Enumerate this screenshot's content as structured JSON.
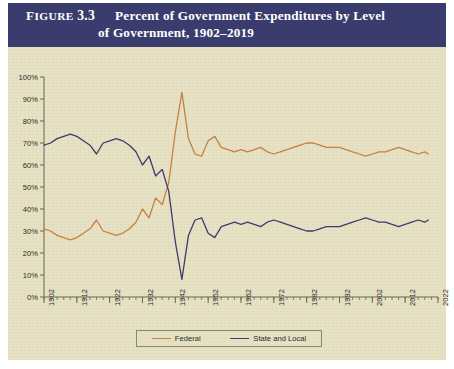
{
  "figure": {
    "label_small_caps": "IGURE",
    "label_first_letter": "F",
    "number": "3.3",
    "title_line1": "Percent of Government Expenditures by Level",
    "title_line2": "of Government, 1902–2019",
    "band_color": "#3b3c6e",
    "panel_color": "#e6e2c3"
  },
  "chart_data": {
    "type": "line",
    "title": "Percent of Government Expenditures by Level of Government, 1902–2019",
    "xlabel": "",
    "ylabel": "",
    "ylim": [
      0,
      100
    ],
    "xlim": [
      1902,
      2022
    ],
    "grid": false,
    "legend_position": "bottom",
    "y_ticks": [
      "0%",
      "10%",
      "20%",
      "30%",
      "40%",
      "50%",
      "60%",
      "70%",
      "80%",
      "90%",
      "100%"
    ],
    "y_tick_values": [
      0,
      10,
      20,
      30,
      40,
      50,
      60,
      70,
      80,
      90,
      100
    ],
    "x_ticks": [
      "1902",
      "1912",
      "1922",
      "1932",
      "1942",
      "1952",
      "1962",
      "1972",
      "1982",
      "1992",
      "2002",
      "2012",
      "2022"
    ],
    "x_tick_values": [
      1902,
      1912,
      1922,
      1932,
      1942,
      1952,
      1962,
      1972,
      1982,
      1992,
      2002,
      2012,
      2022
    ],
    "x_minor_tick_step": 2,
    "series": [
      {
        "name": "Federal",
        "color": "#c8803f",
        "x": [
          1902,
          1904,
          1906,
          1908,
          1910,
          1912,
          1914,
          1916,
          1918,
          1920,
          1922,
          1924,
          1926,
          1928,
          1930,
          1932,
          1934,
          1936,
          1938,
          1940,
          1942,
          1944,
          1946,
          1948,
          1950,
          1952,
          1954,
          1956,
          1958,
          1960,
          1962,
          1964,
          1966,
          1968,
          1970,
          1972,
          1974,
          1976,
          1978,
          1980,
          1982,
          1984,
          1986,
          1988,
          1990,
          1992,
          1994,
          1996,
          1998,
          2000,
          2002,
          2004,
          2006,
          2008,
          2010,
          2012,
          2014,
          2016,
          2018,
          2019
        ],
        "values": [
          31,
          30,
          28,
          27,
          26,
          27,
          29,
          31,
          35,
          30,
          29,
          28,
          29,
          31,
          34,
          40,
          36,
          45,
          42,
          52,
          75,
          93,
          72,
          65,
          64,
          71,
          73,
          68,
          67,
          66,
          67,
          66,
          67,
          68,
          66,
          65,
          66,
          67,
          68,
          69,
          70,
          70,
          69,
          68,
          68,
          68,
          67,
          66,
          65,
          64,
          65,
          66,
          66,
          67,
          68,
          67,
          66,
          65,
          66,
          65
        ]
      },
      {
        "name": "State and Local",
        "color": "#3b3c6e",
        "x": [
          1902,
          1904,
          1906,
          1908,
          1910,
          1912,
          1914,
          1916,
          1918,
          1920,
          1922,
          1924,
          1926,
          1928,
          1930,
          1932,
          1934,
          1936,
          1938,
          1940,
          1942,
          1944,
          1946,
          1948,
          1950,
          1952,
          1954,
          1956,
          1958,
          1960,
          1962,
          1964,
          1966,
          1968,
          1970,
          1972,
          1974,
          1976,
          1978,
          1980,
          1982,
          1984,
          1986,
          1988,
          1990,
          1992,
          1994,
          1996,
          1998,
          2000,
          2002,
          2004,
          2006,
          2008,
          2010,
          2012,
          2014,
          2016,
          2018,
          2019
        ],
        "values": [
          69,
          70,
          72,
          73,
          74,
          73,
          71,
          69,
          65,
          70,
          71,
          72,
          71,
          69,
          66,
          60,
          64,
          55,
          58,
          48,
          25,
          8,
          28,
          35,
          36,
          29,
          27,
          32,
          33,
          34,
          33,
          34,
          33,
          32,
          34,
          35,
          34,
          33,
          32,
          31,
          30,
          30,
          31,
          32,
          32,
          32,
          33,
          34,
          35,
          36,
          35,
          34,
          34,
          33,
          32,
          33,
          34,
          35,
          34,
          35
        ]
      }
    ]
  },
  "legend": {
    "items": [
      {
        "label": "Federal",
        "color": "#c8803f"
      },
      {
        "label": "State and Local",
        "color": "#3b3c6e"
      }
    ]
  }
}
